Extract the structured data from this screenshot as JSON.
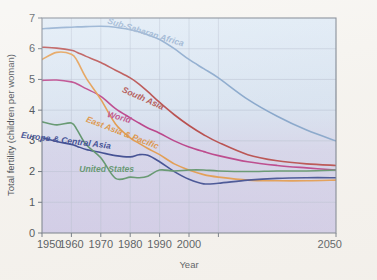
{
  "chart_data": {
    "type": "line",
    "title": "",
    "xlabel": "Year",
    "ylabel": "Total fertility (children per woman)",
    "xlim": [
      1950,
      2050
    ],
    "ylim": [
      0,
      7
    ],
    "grid": true,
    "legend_position": "inline-curve-labels",
    "xticks": [
      1950,
      1960,
      1970,
      1980,
      1990,
      2000,
      2010,
      2050
    ],
    "xtick_labels": [
      "1950",
      "1960",
      "1970",
      "1980",
      "1990",
      "2000",
      "",
      "2050"
    ],
    "yticks": [
      0,
      1,
      2,
      3,
      4,
      5,
      6,
      7
    ],
    "ytick_labels": [
      "0",
      "1",
      "2",
      "3",
      "4",
      "5",
      "6",
      "7"
    ],
    "x": [
      1950,
      1955,
      1960,
      1962,
      1965,
      1970,
      1975,
      1980,
      1983,
      1986,
      1990,
      1995,
      2000,
      2005,
      2010,
      2020,
      2030,
      2040,
      2050
    ],
    "series": [
      {
        "name": "Sub-Saharan Africa",
        "color": "#7b9ec7",
        "label_color": "#8aa7cb",
        "values": [
          6.65,
          6.68,
          6.7,
          6.71,
          6.72,
          6.73,
          6.7,
          6.62,
          6.55,
          6.45,
          6.3,
          6.0,
          5.65,
          5.35,
          5.05,
          4.35,
          3.8,
          3.35,
          3.0
        ]
      },
      {
        "name": "South Asia",
        "color": "#b03a3a",
        "label_color": "#a8423f",
        "values": [
          6.05,
          6.02,
          5.95,
          5.88,
          5.75,
          5.55,
          5.3,
          5.05,
          4.85,
          4.6,
          4.25,
          3.85,
          3.5,
          3.2,
          2.95,
          2.55,
          2.35,
          2.25,
          2.2
        ]
      },
      {
        "name": "World",
        "color": "#b32f7e",
        "label_color": "#b8407f",
        "values": [
          4.97,
          4.98,
          4.92,
          4.85,
          4.7,
          4.45,
          4.05,
          3.75,
          3.58,
          3.42,
          3.25,
          3.0,
          2.8,
          2.65,
          2.52,
          2.32,
          2.2,
          2.12,
          2.05
        ]
      },
      {
        "name": "East Asia & Pacific",
        "color": "#e0913c",
        "label_color": "#d98b38",
        "values": [
          5.65,
          5.88,
          5.82,
          5.6,
          5.05,
          4.35,
          3.55,
          3.1,
          2.92,
          2.75,
          2.55,
          2.25,
          2.05,
          1.9,
          1.82,
          1.72,
          1.7,
          1.7,
          1.72
        ]
      },
      {
        "name": "Europe & Central Asia",
        "color": "#2a3a87",
        "label_color": "#2c3c8a",
        "values": [
          3.1,
          2.98,
          2.88,
          2.82,
          2.72,
          2.62,
          2.52,
          2.48,
          2.55,
          2.53,
          2.32,
          2.0,
          1.75,
          1.6,
          1.62,
          1.72,
          1.78,
          1.8,
          1.8
        ]
      },
      {
        "name": "United States",
        "color": "#4f8a5e",
        "label_color": "#4f8a5e",
        "values": [
          3.62,
          3.52,
          3.58,
          3.35,
          2.88,
          2.45,
          1.78,
          1.82,
          1.8,
          1.85,
          2.05,
          2.02,
          2.05,
          2.05,
          2.02,
          2.0,
          2.02,
          2.02,
          2.05
        ]
      }
    ],
    "annotations": [
      {
        "text": "Sub-Saharan Africa",
        "series": "Sub-Saharan Africa",
        "x": 1985,
        "y": 6.45,
        "rotation": 17
      },
      {
        "text": "South Asia",
        "series": "South Asia",
        "x": 1984,
        "y": 4.3,
        "rotation": 24
      },
      {
        "text": "World",
        "series": "World",
        "x": 1976,
        "y": 3.68,
        "rotation": 16
      },
      {
        "text": "East Asia & Pacific",
        "series": "East Asia & Pacific",
        "x": 1977,
        "y": 3.18,
        "rotation": 21
      },
      {
        "text": "Europe & Central Asia",
        "series": "Europe & Central Asia",
        "x": 1958,
        "y": 2.92,
        "rotation": 7
      },
      {
        "text": "United States",
        "series": "United States",
        "x": 1972,
        "y": 1.97,
        "rotation": 0
      }
    ],
    "colors": {
      "plot_background_top": "#dce9f4",
      "plot_background_bottom": "#cdc8e8",
      "figure_background": "#f5f3ef",
      "grid": "#aeb8cc",
      "axis": "#5a6472",
      "tick_text": "#333a42"
    }
  }
}
